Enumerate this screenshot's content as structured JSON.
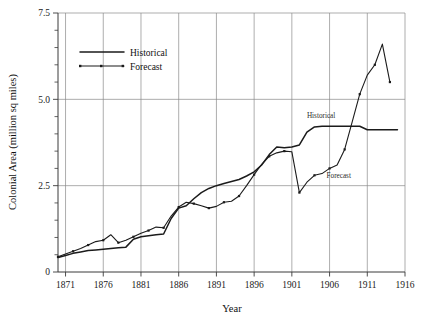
{
  "chart_data": {
    "type": "line",
    "title": "",
    "xlabel": "Year",
    "ylabel": "Colonial Area (million sq miles)",
    "xlim": [
      1870,
      1916
    ],
    "ylim": [
      0,
      7.5
    ],
    "grid": true,
    "legend_position": "upper-left-inside",
    "x_ticks": [
      1871,
      1876,
      1881,
      1886,
      1891,
      1896,
      1901,
      1906,
      1911,
      1916
    ],
    "x_tick_labels": [
      "1871",
      "1876",
      "1881",
      "1886",
      "1891",
      "1896",
      "1901",
      "1906",
      "1911",
      "1916"
    ],
    "y_ticks": [
      0,
      2.5,
      5.0,
      7.5
    ],
    "y_tick_labels": [
      "0",
      "2.5",
      "5.0",
      "7.5"
    ],
    "y_minor_tick_step": 0.5,
    "series": [
      {
        "name": "Historical",
        "style": "solid",
        "marker": "none",
        "color": "#1b1b1b",
        "x": [
          1870,
          1871,
          1872,
          1873,
          1874,
          1875,
          1876,
          1877,
          1878,
          1879,
          1880,
          1881,
          1882,
          1883,
          1884,
          1885,
          1886,
          1887,
          1888,
          1889,
          1890,
          1891,
          1892,
          1893,
          1894,
          1895,
          1896,
          1897,
          1898,
          1899,
          1900,
          1901,
          1902,
          1903,
          1904,
          1905,
          1906,
          1907,
          1908,
          1909,
          1910,
          1911,
          1912,
          1913,
          1914,
          1915
        ],
        "y": [
          0.42,
          0.48,
          0.54,
          0.58,
          0.62,
          0.64,
          0.66,
          0.68,
          0.7,
          0.72,
          0.95,
          1.02,
          1.05,
          1.08,
          1.1,
          1.55,
          1.85,
          1.92,
          2.12,
          2.3,
          2.42,
          2.5,
          2.56,
          2.62,
          2.68,
          2.78,
          2.9,
          3.1,
          3.4,
          3.62,
          3.6,
          3.62,
          3.68,
          4.05,
          4.2,
          4.22,
          4.22,
          4.22,
          4.22,
          4.22,
          4.22,
          4.12,
          4.12,
          4.12,
          4.12,
          4.12
        ]
      },
      {
        "name": "Forecast",
        "style": "solid-with-markers",
        "marker": "square",
        "color": "#1b1b1b",
        "x": [
          1870,
          1871,
          1872,
          1873,
          1874,
          1875,
          1876,
          1877,
          1878,
          1879,
          1880,
          1881,
          1882,
          1883,
          1884,
          1885,
          1886,
          1887,
          1888,
          1889,
          1890,
          1891,
          1892,
          1893,
          1894,
          1895,
          1896,
          1897,
          1898,
          1899,
          1900,
          1901,
          1902,
          1903,
          1904,
          1905,
          1906,
          1907,
          1908,
          1909,
          1910,
          1911,
          1912,
          1913,
          1914
        ],
        "y": [
          0.44,
          0.52,
          0.6,
          0.68,
          0.78,
          0.88,
          0.92,
          1.08,
          0.85,
          0.92,
          1.02,
          1.12,
          1.2,
          1.3,
          1.28,
          1.62,
          1.88,
          2.02,
          1.98,
          1.92,
          1.85,
          1.9,
          2.02,
          2.05,
          2.2,
          2.5,
          2.82,
          3.12,
          3.35,
          3.45,
          3.5,
          3.48,
          2.3,
          2.6,
          2.8,
          2.85,
          3.0,
          3.1,
          3.55,
          4.35,
          5.15,
          5.7,
          6.0,
          6.6,
          5.5
        ]
      }
    ],
    "annotations": [
      {
        "text": "Historical",
        "x": 1903.0,
        "y": 4.45
      },
      {
        "text": "Forecast",
        "x": 1905.6,
        "y": 2.72
      }
    ],
    "legend_entries": [
      {
        "label": "Historical",
        "style": "solid"
      },
      {
        "label": "Forecast",
        "style": "marker-line"
      }
    ]
  }
}
